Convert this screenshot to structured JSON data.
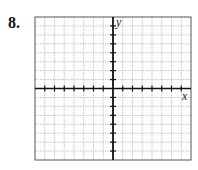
{
  "problem": {
    "number": "8."
  },
  "chart_data": {
    "type": "blank-coordinate-grid",
    "title": "",
    "xlabel": "x",
    "ylabel": "y",
    "grid": true,
    "x_cells": 16,
    "y_cells": 16,
    "xlim": [
      -8,
      8
    ],
    "ylim": [
      -8,
      8
    ],
    "series": []
  },
  "colors": {
    "gridline": "#b8b8b8",
    "axis": "#111111",
    "border": "#555555"
  }
}
